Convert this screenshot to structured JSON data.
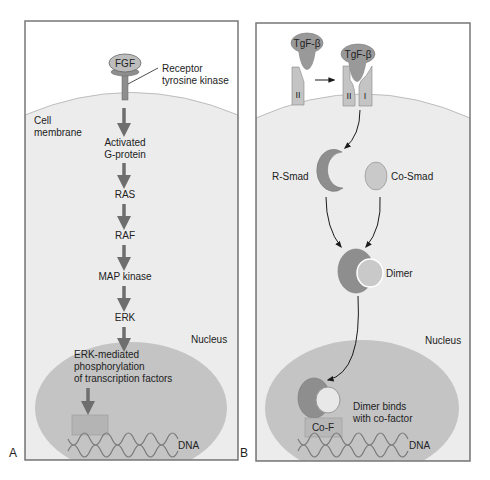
{
  "colors": {
    "panel_border": "#777777",
    "cell_fill": "#ebebeb",
    "nucleus_fill": "#c4c4c4",
    "dark_protein": "#8e8e8e",
    "light_protein": "#c9c9c9",
    "arrow": "#6e6e6e"
  },
  "panel_a": {
    "letter": "A",
    "ligand": "FGF",
    "receptor_label_1": "Receptor",
    "receptor_label_2": "tyrosine kinase",
    "membrane_label_1": "Cell",
    "membrane_label_2": "membrane",
    "steps": [
      "Activated",
      "G-protein",
      "RAS",
      "RAF",
      "MAP kinase",
      "ERK"
    ],
    "nucleus_label": "Nucleus",
    "nuclear_text": [
      "ERK-mediated",
      "phosphorylation",
      "of transcription factors"
    ],
    "dna_label": "DNA"
  },
  "panel_b": {
    "letter": "B",
    "ligand_1": "TgF-β",
    "ligand_2": "TgF-β",
    "receptor_ii_unbound": "II",
    "receptor_ii": "II",
    "receptor_i": "I",
    "r_smad": "R-Smad",
    "co_smad": "Co-Smad",
    "dimer": "Dimer",
    "nucleus_label": "Nucleus",
    "binds_1": "Dimer binds",
    "binds_2": "with co-factor",
    "cofactor": "Co-F",
    "dna_label": "DNA"
  }
}
